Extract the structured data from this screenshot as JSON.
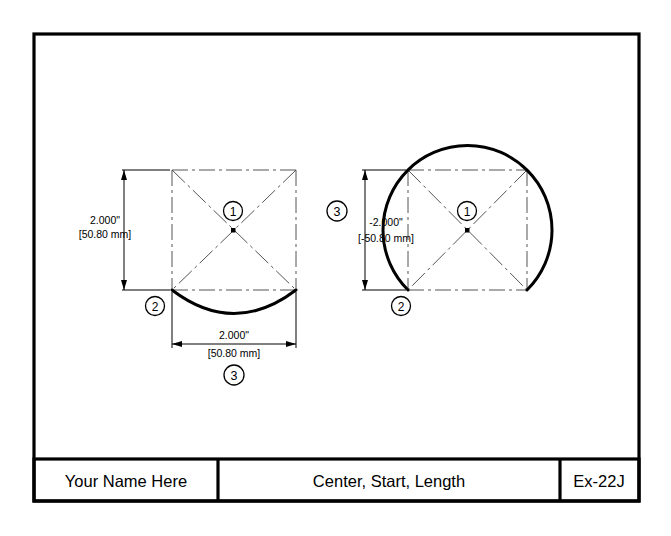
{
  "drawing": {
    "sheet_title": "Center, Start, Length",
    "border_color": "#000000",
    "background_color": "#ffffff"
  },
  "title_block": {
    "name_cell": "Your Name Here",
    "title_cell": "Center, Start, Length",
    "number_cell": "Ex-22J"
  },
  "figures": [
    {
      "id": "left-figure",
      "name": "minor-arc-figure",
      "vertical_dimension": {
        "inches": "2.000\"",
        "millimeters": "[50.80 mm]"
      },
      "horizontal_dimension": {
        "inches": "2.000\"",
        "millimeters": "[50.80 mm]"
      },
      "balloons": [
        {
          "label": "1",
          "meaning": "center"
        },
        {
          "label": "2",
          "meaning": "start"
        },
        {
          "label": "3",
          "meaning": "length"
        }
      ]
    },
    {
      "id": "right-figure",
      "name": "major-arc-figure",
      "vertical_dimension": {
        "inches": "-2.000\"",
        "millimeters": "[-50.80 mm]"
      },
      "balloons": [
        {
          "label": "1",
          "meaning": "center"
        },
        {
          "label": "2",
          "meaning": "start"
        },
        {
          "label": "3",
          "meaning": "length"
        }
      ]
    }
  ]
}
